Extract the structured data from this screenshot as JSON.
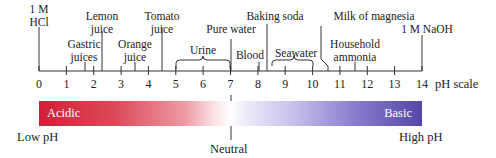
{
  "title": "pH scale",
  "scale": {
    "min": 0,
    "max": 14,
    "label": "pH scale",
    "ticks": [
      "0",
      "1",
      "2",
      "3",
      "4",
      "5",
      "6",
      "7",
      "8",
      "9",
      "10",
      "11",
      "12",
      "13",
      "14"
    ]
  },
  "substances": {
    "hcl": {
      "line1": "1 M",
      "line2": "HCl",
      "ph": 0
    },
    "gastric": {
      "line1": "Gastric",
      "line2": "juices",
      "ph_range": [
        1.6,
        2.0
      ]
    },
    "lemon": {
      "line1": "Lemon",
      "line2": "juice",
      "ph": 2.3
    },
    "orange": {
      "line1": "Orange",
      "line2": "juice",
      "ph": 3.5
    },
    "tomato": {
      "line1": "Tomato",
      "line2": "juice",
      "ph": 4.5
    },
    "urine": {
      "label": "Urine",
      "ph_range": [
        5,
        7
      ]
    },
    "pure_water": {
      "label": "Pure water",
      "ph": 7
    },
    "blood": {
      "label": "Blood",
      "ph": 7.4
    },
    "baking_soda": {
      "label": "Baking soda",
      "ph": 8.3
    },
    "seawater": {
      "label": "Seawater",
      "ph_range": [
        8.5,
        10
      ]
    },
    "milk_of_magnesia": {
      "label": "Milk of magnesia",
      "ph": 10.5
    },
    "ammonia": {
      "line1": "Household",
      "line2": "ammonia",
      "ph": 11.5
    },
    "naoh": {
      "label": "1 M NaOH",
      "ph": 14
    }
  },
  "bar": {
    "acidic": "Acidic",
    "basic": "Basic",
    "acid_color": "#d21f36",
    "base_color": "#5446a8"
  },
  "footer": {
    "low": "Low pH",
    "high": "High pH",
    "neutral": "Neutral"
  }
}
